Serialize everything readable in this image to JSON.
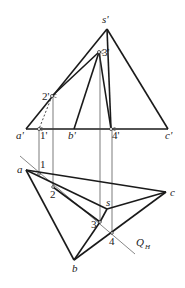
{
  "diagram": {
    "type": "descriptive-geometry-projection",
    "front_view": {
      "labels": {
        "s": "s'",
        "p3": "3'",
        "p2": "2'",
        "a": "a'",
        "p1": "1'",
        "b": "b'",
        "p4": "4'",
        "c": "c'"
      }
    },
    "top_view": {
      "labels": {
        "a": "a",
        "p1": "1",
        "p2": "2",
        "c": "c",
        "s": "s",
        "p3": "3",
        "p4": "4",
        "b": "b",
        "plane": "Q",
        "plane_sub": "H"
      }
    },
    "colors": {
      "line": "#1a1a1a",
      "thin": "#555555"
    }
  }
}
